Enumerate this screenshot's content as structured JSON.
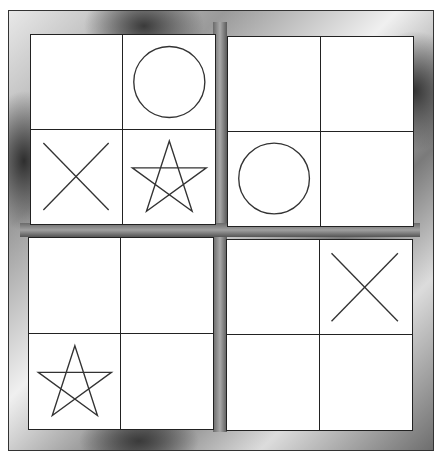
{
  "board": {
    "layout": "2x2 quadrants of 2x2 cells",
    "frame_style": "metallic",
    "line_color": "#222222",
    "mark_color": "#333333",
    "quadrants": [
      {
        "id": "top-left",
        "cells": [
          "",
          "O",
          "X",
          "star"
        ]
      },
      {
        "id": "top-right",
        "cells": [
          "",
          "",
          "O",
          ""
        ]
      },
      {
        "id": "bottom-left",
        "cells": [
          "",
          "",
          "star",
          ""
        ]
      },
      {
        "id": "bottom-right",
        "cells": [
          "",
          "X",
          "",
          ""
        ]
      }
    ]
  }
}
